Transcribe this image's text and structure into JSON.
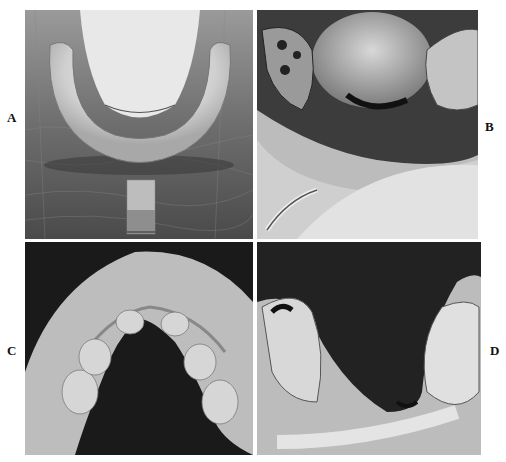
{
  "figure": {
    "panels": [
      {
        "id": "A",
        "label": "A",
        "description": "Mandibular impression tray on leather background, white impression material with handle strip"
      },
      {
        "id": "B",
        "label": "B",
        "description": "Intraoral view showing tongue, molars and impression material with metal instrument"
      },
      {
        "id": "C",
        "label": "C",
        "description": "Maxillary cast on dark background, occlusal view"
      },
      {
        "id": "D",
        "label": "D",
        "description": "Mandibular cast showing posterior teeth on both sides on dark background"
      }
    ]
  }
}
